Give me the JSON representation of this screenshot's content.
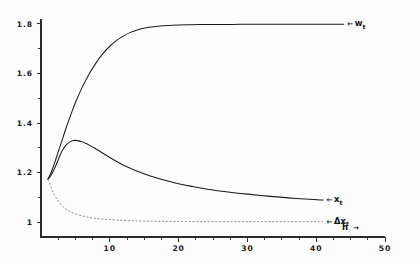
{
  "chart_data": {
    "type": "line",
    "title": "",
    "subtitle": "",
    "xlabel": "h",
    "xlabel_arrow": "→",
    "ylabel": "",
    "xlim": [
      0,
      50
    ],
    "ylim": [
      0.94,
      1.82
    ],
    "grid": false,
    "legend_position": "right-inline",
    "x_ticks_major": [
      10,
      20,
      30,
      40,
      50
    ],
    "x_ticks_major_labels": [
      "10",
      "20",
      "30",
      "40",
      "50"
    ],
    "x_ticks_minor": [
      2.5,
      5,
      7.5,
      12.5,
      15,
      17.5,
      22.5,
      25,
      27.5,
      32.5,
      35,
      37.5,
      42.5,
      45,
      47.5
    ],
    "y_ticks_major": [
      1.0,
      1.2,
      1.4,
      1.6,
      1.8
    ],
    "y_ticks_major_labels": [
      "1",
      "1.2",
      "1.4",
      "1.6",
      "1.8"
    ],
    "y_ticks_minor": [
      1.1,
      1.3,
      1.5,
      1.7
    ],
    "series": [
      {
        "name": "w_t",
        "label_text": "w",
        "label_sub": "t",
        "label_arrow": "←",
        "style": "solid",
        "color": "#1a1a1a",
        "x": [
          1.0,
          1.4,
          1.8,
          2.2,
          2.6,
          3.0,
          3.5,
          4.0,
          4.5,
          5.0,
          6.0,
          7.0,
          8.0,
          9.0,
          10.0,
          11.0,
          12.0,
          13.0,
          14.0,
          15.0,
          16.0,
          17.0,
          18.0,
          19.0,
          20.0,
          22.0,
          24.0,
          26.0,
          28.0,
          30.0,
          33.0,
          36.0,
          40.0,
          44.0
        ],
        "y": [
          1.175,
          1.195,
          1.225,
          1.258,
          1.292,
          1.325,
          1.368,
          1.408,
          1.446,
          1.482,
          1.545,
          1.598,
          1.643,
          1.68,
          1.71,
          1.734,
          1.752,
          1.766,
          1.776,
          1.783,
          1.788,
          1.791,
          1.793,
          1.795,
          1.796,
          1.797,
          1.798,
          1.798,
          1.798,
          1.799,
          1.799,
          1.799,
          1.799,
          1.799
        ]
      },
      {
        "name": "x_t",
        "label_text": "x",
        "label_sub": "t",
        "label_arrow": "←",
        "style": "solid",
        "color": "#1a1a1a",
        "x": [
          1.0,
          1.3,
          1.6,
          2.0,
          2.4,
          2.8,
          3.2,
          3.6,
          4.0,
          4.5,
          5.0,
          5.5,
          6.0,
          6.5,
          7.0,
          8.0,
          9.0,
          10.0,
          11.0,
          12.0,
          13.0,
          14.0,
          16.0,
          18.0,
          20.0,
          22.0,
          24.0,
          26.0,
          28.0,
          30.0,
          33.0,
          36.0,
          39.0,
          41.0
        ],
        "y": [
          1.172,
          1.182,
          1.196,
          1.218,
          1.245,
          1.272,
          1.294,
          1.31,
          1.32,
          1.328,
          1.33,
          1.328,
          1.324,
          1.318,
          1.311,
          1.295,
          1.278,
          1.261,
          1.245,
          1.23,
          1.217,
          1.205,
          1.185,
          1.169,
          1.155,
          1.144,
          1.134,
          1.126,
          1.119,
          1.113,
          1.105,
          1.098,
          1.092,
          1.089
        ]
      },
      {
        "name": "dx_t",
        "label_text": "Δx",
        "label_sub": "t",
        "label_arrow": "←",
        "style": "dashed",
        "color": "#8e8e8e",
        "x": [
          1.0,
          1.2,
          1.5,
          1.8,
          2.1,
          2.5,
          3.0,
          3.5,
          4.0,
          4.5,
          5.0,
          6.0,
          7.0,
          8.0,
          9.0,
          10.0,
          11.0,
          12.0,
          14.0,
          16.0,
          18.0,
          20.0,
          24.0,
          28.0,
          32.0,
          36.0,
          40.0,
          41.0
        ],
        "y": [
          1.172,
          1.16,
          1.138,
          1.118,
          1.102,
          1.085,
          1.068,
          1.056,
          1.046,
          1.039,
          1.033,
          1.025,
          1.019,
          1.015,
          1.012,
          1.01,
          1.008,
          1.007,
          1.005,
          1.004,
          1.003,
          1.003,
          1.002,
          1.002,
          1.002,
          1.002,
          1.002,
          1.002
        ]
      }
    ]
  },
  "figure": {
    "background_color": "#fdfdfd",
    "axis_color": "#2b2b2b"
  }
}
